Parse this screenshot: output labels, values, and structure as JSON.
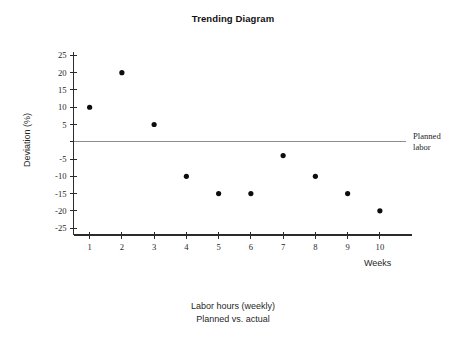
{
  "chart_data": {
    "type": "scatter",
    "title": "Trending Diagram",
    "xlabel": "Weeks",
    "ylabel": "Deviation (%)",
    "x": [
      1,
      2,
      3,
      4,
      5,
      6,
      7,
      8,
      9,
      10
    ],
    "categories": [
      "1",
      "2",
      "3",
      "4",
      "5",
      "6",
      "7",
      "8",
      "9",
      "10"
    ],
    "series": [
      {
        "name": "Actual deviation",
        "values": [
          10,
          20,
          5,
          -10,
          -15,
          -15,
          -4,
          -10,
          -15,
          -20
        ]
      }
    ],
    "xlim": [
      0.5,
      10.5
    ],
    "ylim": [
      -27,
      26
    ],
    "yticks": [
      25,
      20,
      15,
      10,
      5,
      0,
      -5,
      -10,
      -15,
      -20,
      -25
    ],
    "ytick_labels": [
      "25",
      "20",
      "15",
      "10",
      "5",
      "",
      "-5",
      "-10",
      "-15",
      "-20",
      "-25"
    ],
    "xticks": [
      1,
      2,
      3,
      4,
      5,
      6,
      7,
      8,
      9,
      10
    ],
    "xtick_labels": [
      "1",
      "2",
      "3",
      "4",
      "5",
      "6",
      "7",
      "8",
      "9",
      "10"
    ],
    "grid": false,
    "legend": "none",
    "reference_line": {
      "value": 0,
      "label_line1": "Planned",
      "label_line2": "labor",
      "color": "#8d8d8d"
    },
    "marker_color": "#0d0d0d",
    "axis_color": "#2b2b2b",
    "caption_line1": "Labor hours (weekly)",
    "caption_line2": "Planned vs. actual"
  }
}
